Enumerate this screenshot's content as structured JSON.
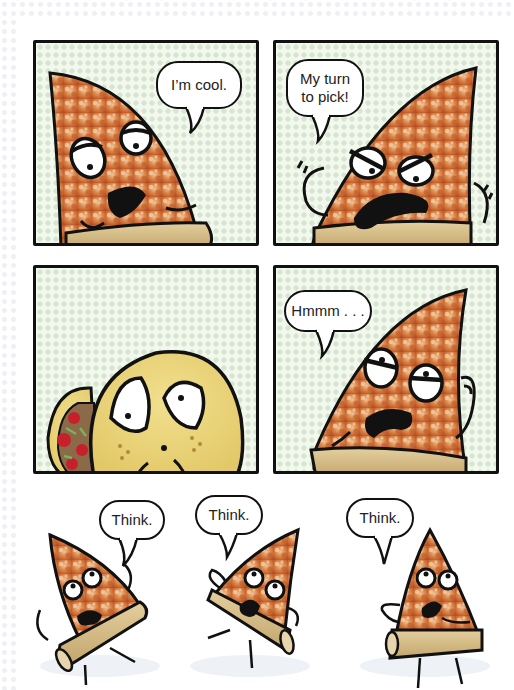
{
  "comic": {
    "panels": [
      {
        "id": 1,
        "character": "pizza-slice",
        "expression": "cool, half-lidded eyes",
        "speech": "I’m cool."
      },
      {
        "id": 2,
        "character": "pizza-slice",
        "expression": "angry, arms raised",
        "speech": "My turn\nto pick!"
      },
      {
        "id": 3,
        "character": "taco",
        "expression": "worried, big eyes",
        "speech": ""
      },
      {
        "id": 4,
        "character": "pizza-slice",
        "expression": "skeptical, hand on chin",
        "speech": "Hmmm . . ."
      }
    ],
    "bottom_row": [
      {
        "id": 5,
        "character": "pizza-slice",
        "pose": "arms up",
        "speech": "Think."
      },
      {
        "id": 6,
        "character": "pizza-slice",
        "pose": "hands on hips",
        "speech": "Think."
      },
      {
        "id": 7,
        "character": "pizza-slice",
        "pose": "hand on chin",
        "speech": "Think."
      }
    ]
  },
  "colors": {
    "panel_bg": "#f3f8ef",
    "panel_dots": "#d6e6cf",
    "outline": "#111111",
    "pizza_sauce": "#c8602a",
    "pizza_cheese": "#e9a46a",
    "crust": "#d8c08c",
    "taco_shell": "#ecd77e"
  }
}
